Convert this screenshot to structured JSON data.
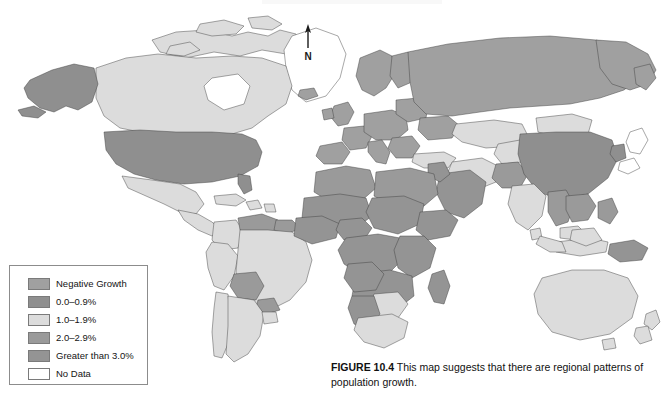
{
  "figure": {
    "title_prefix": "FIGURE 10.4",
    "caption_text": "This map suggests that there are regional patterns of population growth.",
    "caption_full": "FIGURE 10.4 This map suggests that there are regional patterns of population growth."
  },
  "north_arrow": {
    "label": "N",
    "icon": "north-arrow-icon"
  },
  "legend": {
    "items": [
      {
        "label": "Negative Growth",
        "color": "#a0a0a0"
      },
      {
        "label": "0.0–0.9%",
        "color": "#8f8f8f"
      },
      {
        "label": "1.0–1.9%",
        "color": "#dcdcdc"
      },
      {
        "label": "2.0–2.9%",
        "color": "#9a9a9a"
      },
      {
        "label": "Greater than 3.0%",
        "color": "#949494"
      },
      {
        "label": "No Data",
        "color": "#ffffff"
      }
    ]
  },
  "map": {
    "title": "World map of population growth rates",
    "stroke_color": "#3c3c3c",
    "background": "#ffffff",
    "regions": [
      {
        "name": "Greenland",
        "class": "no-data",
        "color": "#ffffff"
      },
      {
        "name": "Canada",
        "class": "1.0-1.9%",
        "color": "#dcdcdc"
      },
      {
        "name": "Alaska",
        "class": "0.0-0.9%",
        "color": "#8f8f8f"
      },
      {
        "name": "United States",
        "class": "0.0-0.9%",
        "color": "#8f8f8f"
      },
      {
        "name": "Mexico",
        "class": "1.0-1.9%",
        "color": "#dcdcdc"
      },
      {
        "name": "Central America",
        "class": "1.0-1.9%",
        "color": "#dcdcdc"
      },
      {
        "name": "Brazil",
        "class": "1.0-1.9%",
        "color": "#dcdcdc"
      },
      {
        "name": "Argentina",
        "class": "1.0-1.9%",
        "color": "#dcdcdc"
      },
      {
        "name": "Bolivia",
        "class": "2.0-2.9%",
        "color": "#9a9a9a"
      },
      {
        "name": "Venezuela",
        "class": "2.0-2.9%",
        "color": "#9a9a9a"
      },
      {
        "name": "Paraguay",
        "class": "2.0-2.9%",
        "color": "#9a9a9a"
      },
      {
        "name": "Europe",
        "class": "negative",
        "color": "#a0a0a0"
      },
      {
        "name": "Russia",
        "class": "negative",
        "color": "#a0a0a0"
      },
      {
        "name": "Kazakhstan",
        "class": "1.0-1.9%",
        "color": "#dcdcdc"
      },
      {
        "name": "North Africa",
        "class": "2.0-2.9%",
        "color": "#9a9a9a"
      },
      {
        "name": "Sub-Saharan Africa",
        "class": "greater-3.0%",
        "color": "#949494"
      },
      {
        "name": "South Africa",
        "class": "1.0-1.9%",
        "color": "#dcdcdc"
      },
      {
        "name": "Middle East",
        "class": "greater-3.0%",
        "color": "#949494"
      },
      {
        "name": "China",
        "class": "0.0-0.9%",
        "color": "#8f8f8f"
      },
      {
        "name": "India",
        "class": "1.0-1.9%",
        "color": "#dcdcdc"
      },
      {
        "name": "Mongolia",
        "class": "1.0-1.9%",
        "color": "#dcdcdc"
      },
      {
        "name": "Japan",
        "class": "no-data",
        "color": "#ffffff"
      },
      {
        "name": "Southeast Asia",
        "class": "2.0-2.9%",
        "color": "#9a9a9a"
      },
      {
        "name": "Indonesia",
        "class": "1.0-1.9%",
        "color": "#dcdcdc"
      },
      {
        "name": "Papua New Guinea",
        "class": "greater-3.0%",
        "color": "#949494"
      },
      {
        "name": "Australia",
        "class": "1.0-1.9%",
        "color": "#dcdcdc"
      },
      {
        "name": "New Zealand",
        "class": "1.0-1.9%",
        "color": "#dcdcdc"
      },
      {
        "name": "Madagascar",
        "class": "greater-3.0%",
        "color": "#949494"
      }
    ]
  }
}
